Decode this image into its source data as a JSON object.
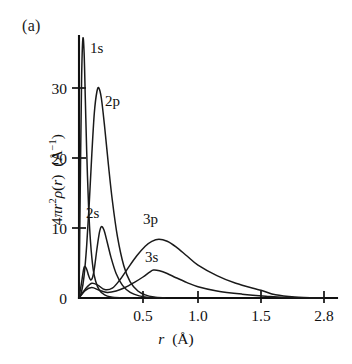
{
  "panel": {
    "label": "(a)"
  },
  "axes": {
    "ylabel": "4πr²ρ(r)  (Å⁻¹)",
    "ylabel_parts": {
      "prefix": "4π",
      "var1": "r",
      "exp1": "2",
      "rho": "ρ(",
      "var2": "r",
      "close": ")",
      "unit_open": "(Å",
      "unit_exp": "−1",
      "unit_close": ")"
    },
    "xlabel": "r  (Å)",
    "xlabel_parts": {
      "var": "r",
      "unit": "(Å)"
    },
    "yticks": [
      "0",
      "10",
      "20",
      "30"
    ],
    "xticks": [
      "0.5",
      "1.0",
      "1.5",
      "2.8"
    ],
    "axis_color": "#111111"
  },
  "curve_labels": {
    "s1": "1s",
    "p2": "2p",
    "s2": "2s",
    "p3": "3p",
    "s3": "3s"
  },
  "chart_data": {
    "type": "line",
    "title": "",
    "subtitle": "",
    "xlabel": "r (Å)",
    "ylabel": "4πr²ρ(r) (Å⁻¹)",
    "panel_label": "(a)",
    "grid": false,
    "legend": "inline-curve-labels",
    "xlim": [
      0,
      2.8
    ],
    "ylim": [
      0,
      37
    ],
    "x_tick_values": [
      0.5,
      1.0,
      1.5,
      2.8
    ],
    "x_tick_labels": [
      "0.5",
      "1.0",
      "1.5",
      "2.8"
    ],
    "x_axis_note": "nonlinear / compressed beyond 1.5",
    "y_tick_values": [
      0,
      10,
      20,
      30
    ],
    "y_tick_labels": [
      "0",
      "10",
      "20",
      "30"
    ],
    "series": [
      {
        "name": "1s",
        "label": "1s",
        "peak_r": 0.03,
        "peak_value": 37,
        "clipped_at_top": true,
        "x": [
          0.0,
          0.01,
          0.02,
          0.03,
          0.04,
          0.05,
          0.06,
          0.075,
          0.09,
          0.11,
          0.13,
          0.16,
          0.2,
          0.25,
          0.32,
          0.42
        ],
        "y": [
          0.0,
          16.0,
          31.0,
          37.0,
          35.0,
          28.0,
          21.0,
          13.0,
          8.0,
          4.2,
          2.4,
          1.1,
          0.45,
          0.15,
          0.04,
          0.0
        ]
      },
      {
        "name": "2p",
        "label": "2p",
        "peak_r": 0.155,
        "peak_value": 30.0,
        "x": [
          0.0,
          0.02,
          0.04,
          0.06,
          0.08,
          0.1,
          0.12,
          0.14,
          0.155,
          0.175,
          0.2,
          0.23,
          0.26,
          0.3,
          0.35,
          0.4,
          0.46,
          0.52,
          0.6,
          0.7
        ],
        "y": [
          0.0,
          0.9,
          3.2,
          7.5,
          13.5,
          20.5,
          26.5,
          29.5,
          30.0,
          28.5,
          24.5,
          19.0,
          14.0,
          8.8,
          4.6,
          2.3,
          1.0,
          0.45,
          0.15,
          0.0
        ]
      },
      {
        "name": "2s",
        "label": "2s",
        "peak_r": 0.175,
        "peak_value": 10.2,
        "x": [
          0.0,
          0.02,
          0.04,
          0.06,
          0.075,
          0.09,
          0.105,
          0.12,
          0.14,
          0.16,
          0.175,
          0.195,
          0.22,
          0.25,
          0.29,
          0.34,
          0.4,
          0.47,
          0.55,
          0.65
        ],
        "y": [
          0.0,
          2.2,
          4.4,
          4.1,
          3.2,
          2.6,
          2.9,
          4.2,
          7.0,
          9.4,
          10.2,
          9.7,
          8.0,
          5.8,
          3.5,
          1.8,
          0.8,
          0.3,
          0.08,
          0.0
        ]
      },
      {
        "name": "3p",
        "label": "3p",
        "peak_r": 0.645,
        "peak_value": 8.4,
        "x": [
          0.0,
          0.05,
          0.1,
          0.15,
          0.2,
          0.26,
          0.32,
          0.38,
          0.45,
          0.52,
          0.58,
          0.645,
          0.72,
          0.8,
          0.9,
          1.0,
          1.15,
          1.3,
          1.5,
          1.8,
          2.2,
          2.8
        ],
        "y": [
          0.0,
          1.3,
          2.1,
          1.8,
          1.2,
          1.4,
          2.6,
          4.2,
          6.0,
          7.4,
          8.1,
          8.4,
          8.1,
          7.3,
          6.0,
          4.7,
          3.2,
          2.1,
          1.1,
          0.45,
          0.15,
          0.0
        ]
      },
      {
        "name": "3s",
        "label": "3s",
        "peak_r": 0.595,
        "peak_value": 4.0,
        "x": [
          0.0,
          0.05,
          0.1,
          0.16,
          0.22,
          0.29,
          0.36,
          0.43,
          0.5,
          0.56,
          0.595,
          0.65,
          0.72,
          0.8,
          0.9,
          1.0,
          1.15,
          1.35,
          1.6,
          2.0,
          2.8
        ],
        "y": [
          0.0,
          1.1,
          1.5,
          1.1,
          0.8,
          1.0,
          1.5,
          2.2,
          3.0,
          3.7,
          4.0,
          3.9,
          3.5,
          2.9,
          2.2,
          1.6,
          1.0,
          0.55,
          0.25,
          0.08,
          0.0
        ]
      }
    ]
  }
}
